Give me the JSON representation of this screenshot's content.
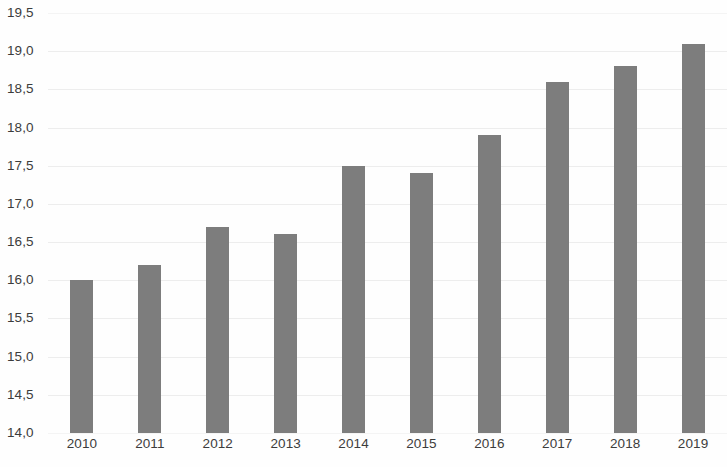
{
  "chart_data": {
    "type": "bar",
    "title": "",
    "subtitle": "",
    "xlabel": "",
    "ylabel": "",
    "categories": [
      "2010",
      "2011",
      "2012",
      "2013",
      "2014",
      "2015",
      "2016",
      "2017",
      "2018",
      "2019"
    ],
    "values": [
      16.0,
      16.2,
      16.7,
      16.6,
      17.5,
      17.4,
      17.9,
      18.6,
      18.8,
      19.1
    ],
    "value_labels": [
      "16,0",
      "16,2",
      "16,7",
      "16,6",
      "17,5",
      "17,4",
      "17,9",
      "18,6",
      "18,8",
      "19,1"
    ],
    "ylim": [
      14.0,
      19.5
    ],
    "ytick_values": [
      19.5,
      19.0,
      18.5,
      18.0,
      17.5,
      17.0,
      16.5,
      16.0,
      15.5,
      15.0,
      14.5,
      14.0
    ],
    "ytick_labels": [
      "19,5",
      "19,0",
      "18,5",
      "18,0",
      "17,5",
      "17,0",
      "16,5",
      "16,0",
      "15,5",
      "15,0",
      "14,5",
      "14,0"
    ],
    "decimal_separator": ",",
    "grid": true,
    "grid_axis": "y",
    "legend": false,
    "legend_position": "none",
    "series": [
      {
        "name": "",
        "values": [
          16.0,
          16.2,
          16.7,
          16.6,
          17.5,
          17.4,
          17.9,
          18.6,
          18.8,
          19.1
        ]
      }
    ],
    "colors": {
      "bar": "#7d7d7d",
      "grid": "#ededed",
      "text": "#3c3c3c",
      "background": "#fefefe"
    }
  }
}
